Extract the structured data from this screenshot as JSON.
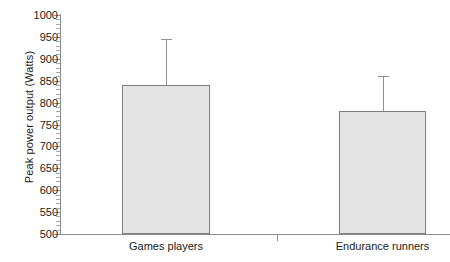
{
  "chart_data": {
    "type": "bar",
    "title": "",
    "xlabel": "",
    "ylabel": "Peak power output (Watts)",
    "categories": [
      "Games players",
      "Endurance runners"
    ],
    "values": [
      840,
      780
    ],
    "errors_upper": [
      945,
      860
    ],
    "error_bars": [
      105,
      80
    ],
    "ylim": [
      500,
      1000
    ],
    "ytick_labels": [
      "1000",
      "950",
      "900",
      "850",
      "800",
      "750",
      "700",
      "650",
      "600",
      "550",
      "500"
    ],
    "ytick_values": [
      1000,
      950,
      900,
      850,
      800,
      750,
      700,
      650,
      600,
      550,
      500
    ],
    "ytick_step": 50,
    "yminor_step": 10,
    "grid": false,
    "legend": null,
    "bar_fill_color": "#e4e4e4",
    "bar_border_color": "#7d7d7d",
    "axis_color": "#8c8c8c",
    "error_bar_color": "#8f8f8f",
    "background_color": "#ffffff"
  }
}
